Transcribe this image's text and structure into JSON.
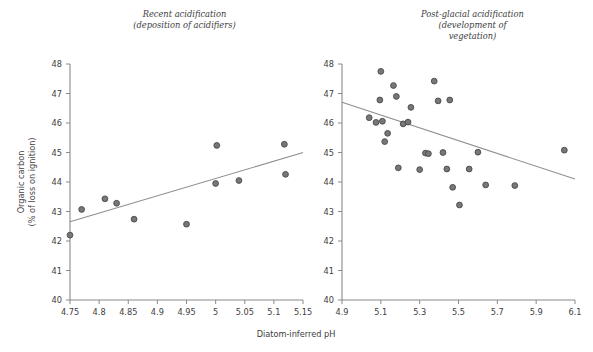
{
  "figure": {
    "width": 593,
    "height": 352,
    "background": "#ffffff",
    "marker_fill": "#777777",
    "marker_stroke": "#4a4a4a",
    "axis_color": "#8a8a8a",
    "trend_color": "#8f8f8f",
    "shared_ylabel_line1": "Organic carbon",
    "shared_ylabel_line2": "(% of loss on ignition)",
    "shared_xlabel": "Diatom-inferred pH"
  },
  "chart_data": [
    {
      "type": "scatter",
      "panel": "left",
      "title": "Recent acidification\n(deposition of acidifiers)",
      "title_lines": [
        "Recent acidification",
        "(deposition of acidifiers)"
      ],
      "xlabel": "Diatom-inferred pH",
      "ylabel": "Organic carbon (% of loss on ignition)",
      "xlim": [
        4.75,
        5.15
      ],
      "ylim": [
        40,
        48
      ],
      "xticks": [
        4.75,
        4.8,
        4.85,
        4.9,
        4.95,
        5.0,
        5.05,
        5.1,
        5.15
      ],
      "xticklabels": [
        "4.75",
        "4.8",
        "4.85",
        "4.9",
        "4.95",
        "5",
        "5.05",
        "5.1",
        "5.15"
      ],
      "yticks": [
        40,
        41,
        42,
        43,
        44,
        45,
        46,
        47,
        48
      ],
      "yticklabels": [
        "40",
        "41",
        "42",
        "43",
        "44",
        "45",
        "46",
        "47",
        "48"
      ],
      "grid": false,
      "legend": "none",
      "points": [
        {
          "x": 4.75,
          "y": 42.2
        },
        {
          "x": 4.77,
          "y": 43.07
        },
        {
          "x": 4.81,
          "y": 43.43
        },
        {
          "x": 4.83,
          "y": 43.28
        },
        {
          "x": 4.86,
          "y": 42.74
        },
        {
          "x": 4.95,
          "y": 42.57
        },
        {
          "x": 5.0,
          "y": 43.95
        },
        {
          "x": 5.002,
          "y": 45.24
        },
        {
          "x": 5.04,
          "y": 44.05
        },
        {
          "x": 5.118,
          "y": 45.28
        },
        {
          "x": 5.12,
          "y": 44.26
        }
      ],
      "trendline": {
        "x0": 4.75,
        "y0": 42.65,
        "x1": 5.15,
        "y1": 45.0,
        "slope_sign": "positive"
      }
    },
    {
      "type": "scatter",
      "panel": "right",
      "title": "Post-glacial acidification\n(development of vegetation)",
      "title_lines": [
        "Post-glacial acidification",
        "(development of",
        "vegetation)"
      ],
      "xlabel": "Diatom-inferred pH",
      "ylabel": "Organic carbon (% of loss on ignition)",
      "xlim": [
        4.9,
        6.1
      ],
      "ylim": [
        40,
        48
      ],
      "xticks": [
        4.9,
        5.1,
        5.3,
        5.5,
        5.7,
        5.9,
        6.1
      ],
      "xticklabels": [
        "4.9",
        "5.1",
        "5.3",
        "5.5",
        "5.7",
        "5.9",
        "6.1"
      ],
      "yticks": [
        40,
        41,
        42,
        43,
        44,
        45,
        46,
        47,
        48
      ],
      "yticklabels": [
        "40",
        "41",
        "42",
        "43",
        "44",
        "45",
        "46",
        "47",
        "48"
      ],
      "grid": false,
      "legend": "none",
      "points": [
        {
          "x": 5.1,
          "y": 47.75
        },
        {
          "x": 5.095,
          "y": 46.78
        },
        {
          "x": 5.04,
          "y": 46.18
        },
        {
          "x": 5.075,
          "y": 46.02
        },
        {
          "x": 5.108,
          "y": 46.06
        },
        {
          "x": 5.12,
          "y": 45.37
        },
        {
          "x": 5.135,
          "y": 45.65
        },
        {
          "x": 5.165,
          "y": 47.27
        },
        {
          "x": 5.18,
          "y": 46.9
        },
        {
          "x": 5.19,
          "y": 44.48
        },
        {
          "x": 5.215,
          "y": 45.97
        },
        {
          "x": 5.24,
          "y": 46.03
        },
        {
          "x": 5.255,
          "y": 46.53
        },
        {
          "x": 5.3,
          "y": 44.42
        },
        {
          "x": 5.33,
          "y": 44.98
        },
        {
          "x": 5.345,
          "y": 44.96
        },
        {
          "x": 5.375,
          "y": 47.42
        },
        {
          "x": 5.395,
          "y": 46.75
        },
        {
          "x": 5.42,
          "y": 45.0
        },
        {
          "x": 5.44,
          "y": 44.44
        },
        {
          "x": 5.455,
          "y": 46.78
        },
        {
          "x": 5.47,
          "y": 43.82
        },
        {
          "x": 5.505,
          "y": 43.22
        },
        {
          "x": 5.555,
          "y": 44.44
        },
        {
          "x": 5.6,
          "y": 45.01
        },
        {
          "x": 5.64,
          "y": 43.9
        },
        {
          "x": 5.79,
          "y": 43.88
        },
        {
          "x": 6.045,
          "y": 45.08
        }
      ],
      "trendline": {
        "x0": 4.9,
        "y0": 46.7,
        "x1": 6.1,
        "y1": 44.1,
        "slope_sign": "negative"
      }
    }
  ]
}
